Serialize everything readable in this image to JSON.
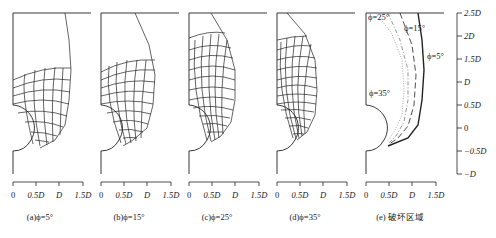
{
  "figure": {
    "panels": [
      {
        "id": "a",
        "caption": "(a)ϕ=5°",
        "phi_deg": 5
      },
      {
        "id": "b",
        "caption": "(b)ϕ=15°",
        "phi_deg": 15
      },
      {
        "id": "c",
        "caption": "(c)ϕ=25°",
        "phi_deg": 25
      },
      {
        "id": "d",
        "caption": "(d)ϕ=35°",
        "phi_deg": 35
      },
      {
        "id": "e",
        "caption": "(e) 破坏区域"
      }
    ],
    "x_axis": {
      "ticks": [
        "0",
        "0.5D",
        "D",
        "1.5D"
      ]
    },
    "y_axis": {
      "ticks": [
        "2.5D",
        "2D",
        "1.5D",
        "D",
        "0.5D",
        "0",
        "−0.5D",
        "−D"
      ]
    },
    "legend_curves": [
      {
        "label": "ϕ=5°",
        "style": "solid-thick"
      },
      {
        "label": "ϕ=15°",
        "style": "long-dash"
      },
      {
        "label": "ϕ=25°",
        "style": "dash-dot"
      },
      {
        "label": "ϕ=35°",
        "style": "dotted"
      }
    ],
    "colors": {
      "line": "#222222",
      "grey": "#888888",
      "background": "#ffffff"
    }
  }
}
